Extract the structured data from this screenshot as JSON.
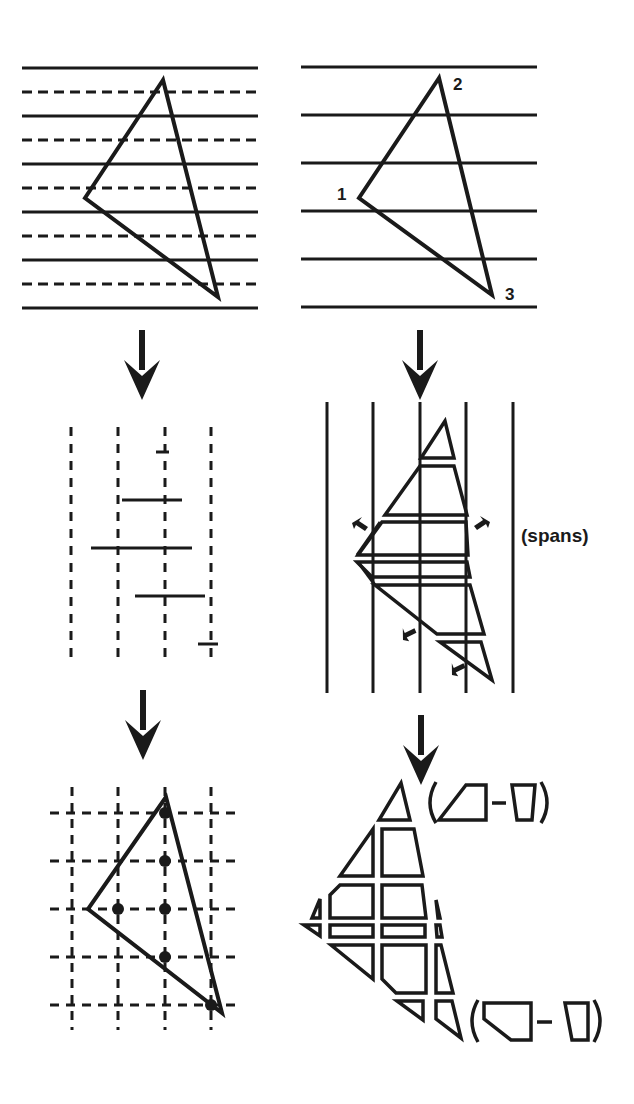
{
  "colors": {
    "ink": "#1a1a1a",
    "background": "#ffffff"
  },
  "left_column": {
    "title": "point-sampling rasterization",
    "top_panel": {
      "scanline_pattern": "alternating solid and dashed horizontal lines",
      "solid_line_count": 6,
      "dashed_line_count": 5,
      "triangle_vertices": [
        [
          163,
          80
        ],
        [
          85,
          198
        ],
        [
          218,
          297
        ]
      ]
    },
    "middle_panel": {
      "dashed_column_count": 4,
      "span_segment_count": 5
    },
    "bottom_panel": {
      "grid": "dashed 4x5 sample grid",
      "sample_dot_count": 7
    }
  },
  "right_column": {
    "title": "area-sampling rasterization",
    "top_panel": {
      "scanline_count": 6,
      "vertex_labels": [
        "1",
        "2",
        "3"
      ]
    },
    "middle_panel": {
      "label": "(spans)",
      "column_count": 5,
      "pointer_arrow_count": 5
    },
    "bottom_panel": {
      "fragment_pieces": "triangle split into clipped polygon fragments",
      "formula_top": "(trapezoid − quad)",
      "formula_bottom": "(pentagon − quad)"
    }
  },
  "arrows": {
    "count": 4,
    "direction": "down"
  }
}
